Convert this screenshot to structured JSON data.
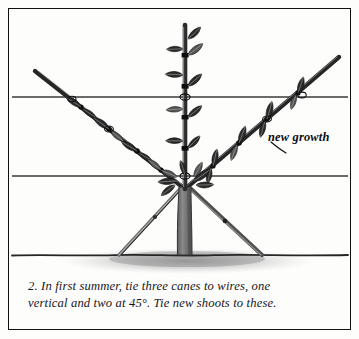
{
  "figure": {
    "number": "2.",
    "caption_lines": [
      "2.  In first summer, tie three canes to wires, one",
      "vertical and two at 45°. Tie new shoots to these."
    ],
    "caption_full": "2. In first summer, tie three canes to wires, one vertical and two at 45°. Tie new shoots to these.",
    "annotation_label": "new growth",
    "border_color": "#111111",
    "background_color": "#fdfdfc",
    "ink_color": "#1a1a1a",
    "cane_color": "#2e2e2e",
    "trunk_color": "#707070",
    "wire_color": "#3a3a3a",
    "soil_shadow_color": "#9a9a9a"
  },
  "diagram": {
    "type": "line-illustration",
    "wires": [
      {
        "name": "upper-wire",
        "y": 88,
        "x_start": 3,
        "x_end": 339
      },
      {
        "name": "lower-wire",
        "y": 167,
        "x_start": 3,
        "x_end": 339
      }
    ],
    "ground_line": {
      "y": 246,
      "x_start": 3,
      "x_end": 339
    },
    "canes": [
      {
        "name": "vertical-cane",
        "angle_deg": 90,
        "x": 176,
        "y_top": 16,
        "y_bottom": 246
      },
      {
        "name": "left-cane-45",
        "angle_deg": 45,
        "tip_x": 26,
        "tip_y": 62,
        "base_x": 176,
        "base_y": 178
      },
      {
        "name": "right-cane-45",
        "angle_deg": 45,
        "tip_x": 330,
        "tip_y": 48,
        "base_x": 176,
        "base_y": 178
      }
    ],
    "stakes": [
      {
        "name": "left-support-stake",
        "top_x": 172,
        "top_y": 180,
        "bottom_x": 110,
        "bottom_y": 246
      },
      {
        "name": "right-support-stake",
        "top_x": 180,
        "top_y": 180,
        "bottom_x": 253,
        "bottom_y": 246
      }
    ],
    "tie_points": [
      {
        "name": "tie-vertical-upper-wire",
        "x": 176,
        "y": 88
      },
      {
        "name": "tie-vertical-lower-wire",
        "x": 176,
        "y": 167
      },
      {
        "name": "tie-left-cane-upper-wire",
        "x": 100,
        "y": 88
      },
      {
        "name": "tie-right-cane-upper-wire",
        "x": 256,
        "y": 88
      }
    ]
  }
}
